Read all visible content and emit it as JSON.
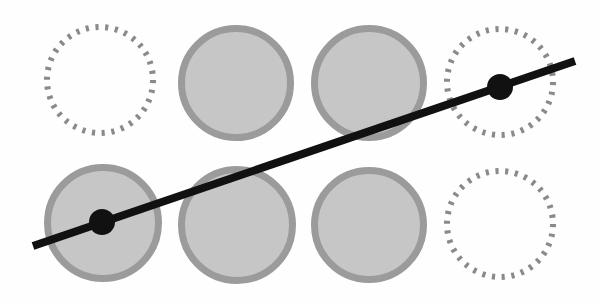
{
  "diagram": {
    "colors": {
      "background": "#fefefe",
      "circle_fill": "#c6c6c6",
      "circle_stroke": "#9b9b9b",
      "dashed_stroke": "#8a8a8a",
      "line": "#111111",
      "point": "#111111"
    },
    "circles": [
      {
        "row": 1,
        "col": 1,
        "cx": 100,
        "cy": 80,
        "r": 57,
        "style": "dashed"
      },
      {
        "row": 1,
        "col": 2,
        "cx": 236,
        "cy": 83,
        "r": 58,
        "style": "filled"
      },
      {
        "row": 1,
        "col": 3,
        "cx": 369,
        "cy": 83,
        "r": 58,
        "style": "filled"
      },
      {
        "row": 1,
        "col": 4,
        "cx": 500,
        "cy": 82,
        "r": 57,
        "style": "dashed"
      },
      {
        "row": 2,
        "col": 1,
        "cx": 103,
        "cy": 223,
        "r": 59,
        "style": "filled"
      },
      {
        "row": 2,
        "col": 2,
        "cx": 237,
        "cy": 225,
        "r": 59,
        "style": "filled"
      },
      {
        "row": 2,
        "col": 3,
        "cx": 369,
        "cy": 225,
        "r": 58,
        "style": "filled"
      },
      {
        "row": 2,
        "col": 4,
        "cx": 500,
        "cy": 224,
        "r": 57,
        "style": "dashed"
      }
    ],
    "line": {
      "x1": 33,
      "y1": 246,
      "x2": 575,
      "y2": 61,
      "width": 8
    },
    "points": [
      {
        "cx": 102,
        "cy": 222,
        "r": 13
      },
      {
        "cx": 500,
        "cy": 87,
        "r": 13
      }
    ]
  }
}
